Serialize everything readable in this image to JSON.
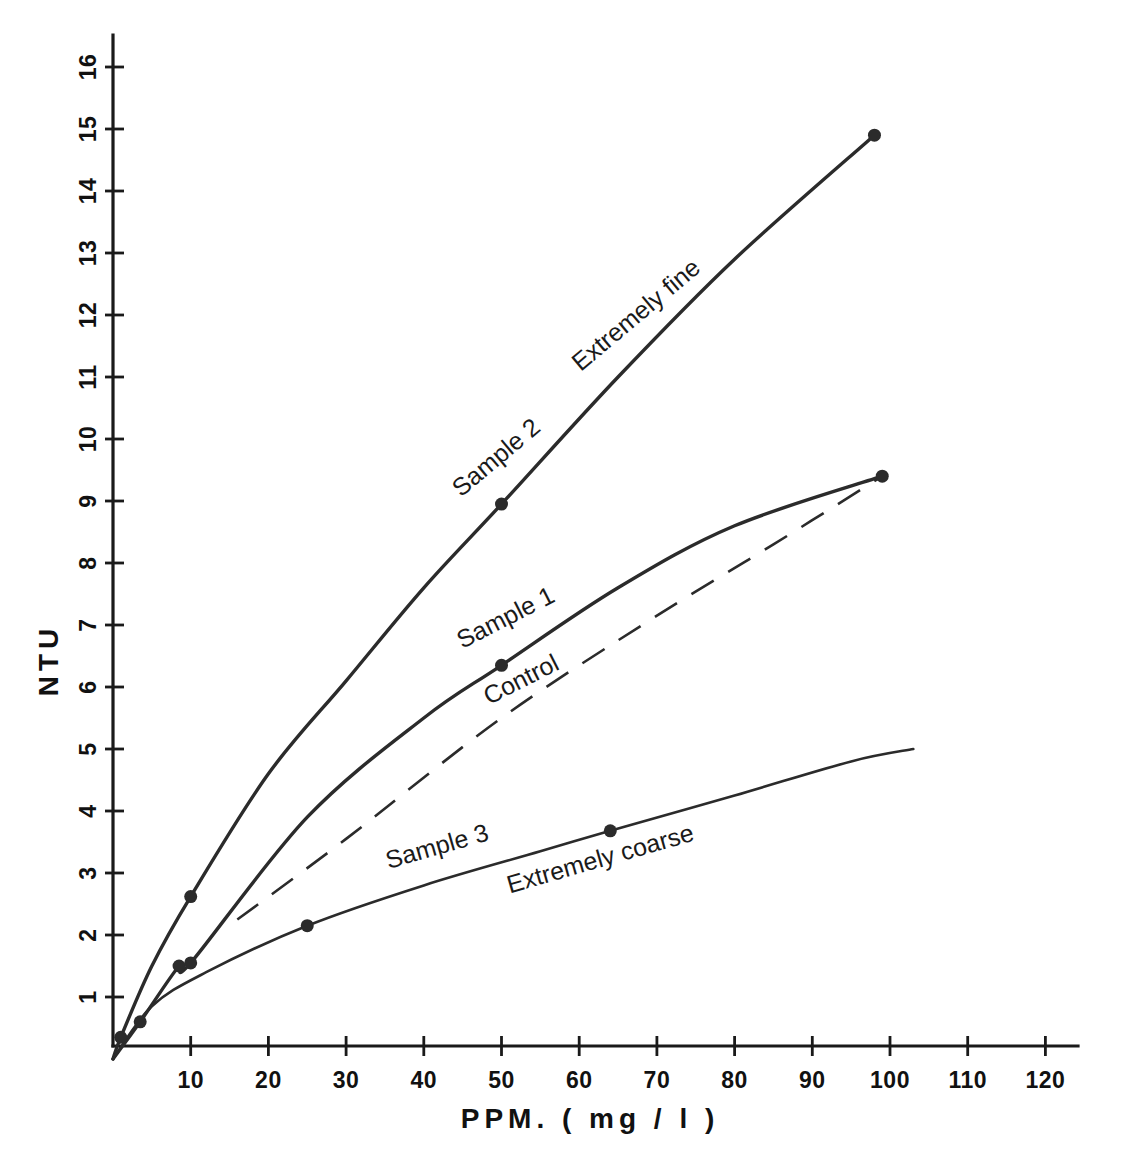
{
  "chart_data": {
    "type": "line",
    "title": "",
    "xlabel": "PPM. ( mg / l )",
    "ylabel": "NTU",
    "xlim": [
      0,
      123
    ],
    "ylim": [
      0,
      16.6
    ],
    "grid": false,
    "legend": "inline-curve-labels",
    "xticks": [
      10,
      20,
      30,
      40,
      50,
      60,
      70,
      80,
      90,
      100,
      110,
      120
    ],
    "xtick_labels": [
      "10",
      "20",
      "30",
      "40",
      "50",
      "60",
      "70",
      "80",
      "90",
      "100",
      "110",
      "120"
    ],
    "yticks": [
      1,
      2,
      3,
      4,
      5,
      6,
      7,
      8,
      9,
      10,
      11,
      12,
      13,
      14,
      15,
      16
    ],
    "ytick_labels": [
      "1",
      "2",
      "3",
      "4",
      "5",
      "6",
      "7",
      "8",
      "9",
      "10",
      "11",
      "12",
      "13",
      "14",
      "15",
      "16"
    ],
    "series": [
      {
        "name": "Sample 2",
        "annotation": "Extremely fine",
        "style": "solid",
        "x": [
          0,
          1,
          5,
          10,
          20,
          30,
          40,
          50,
          65,
          80,
          98
        ],
        "y": [
          0,
          0.35,
          1.5,
          2.62,
          4.6,
          6.1,
          7.6,
          8.95,
          11.0,
          12.9,
          14.9
        ],
        "points_x": [
          1,
          10,
          50,
          98
        ],
        "points_y": [
          0.35,
          2.62,
          8.95,
          14.9
        ]
      },
      {
        "name": "Sample 1",
        "annotation": "",
        "style": "solid",
        "x": [
          0,
          3.5,
          8.5,
          10,
          25,
          40,
          50,
          65,
          80,
          99
        ],
        "y": [
          0,
          0.6,
          1.5,
          1.55,
          3.9,
          5.5,
          6.35,
          7.6,
          8.6,
          9.4
        ],
        "points_x": [
          3.5,
          8.5,
          10,
          50,
          99
        ],
        "points_y": [
          0.6,
          1.5,
          1.55,
          6.35,
          9.4
        ]
      },
      {
        "name": "Control",
        "annotation": "",
        "style": "dashed",
        "x": [
          16,
          30,
          50,
          70,
          85,
          99
        ],
        "y": [
          2.25,
          3.55,
          5.5,
          7.15,
          8.3,
          9.4
        ],
        "points_x": [],
        "points_y": []
      },
      {
        "name": "Sample 3",
        "annotation": "Extremely coarse",
        "style": "solid",
        "x": [
          0,
          5,
          12,
          25,
          40,
          55,
          64,
          80,
          95,
          103
        ],
        "y": [
          0,
          0.85,
          1.4,
          2.15,
          2.8,
          3.35,
          3.68,
          4.25,
          4.8,
          5.0
        ],
        "points_x": [
          25,
          64
        ],
        "points_y": [
          2.15,
          3.68
        ]
      }
    ],
    "annotations": [
      {
        "text": "Sample 2",
        "x_ppm": 50,
        "ntu": 9.6,
        "rotation": -40
      },
      {
        "text": "Extremely fine",
        "x_ppm": 68,
        "ntu": 11.9,
        "rotation": -40
      },
      {
        "text": "Sample 1",
        "x_ppm": 51,
        "ntu": 7.0,
        "rotation": -27
      },
      {
        "text": "Control",
        "x_ppm": 53,
        "ntu": 6.0,
        "rotation": -27
      },
      {
        "text": "Sample 3",
        "x_ppm": 42,
        "ntu": 3.3,
        "rotation": -16
      },
      {
        "text": "Extremely coarse",
        "x_ppm": 63,
        "ntu": 3.1,
        "rotation": -16
      }
    ]
  },
  "axes": {
    "x_title": "PPM. ( mg / l )",
    "y_title": "NTU"
  }
}
